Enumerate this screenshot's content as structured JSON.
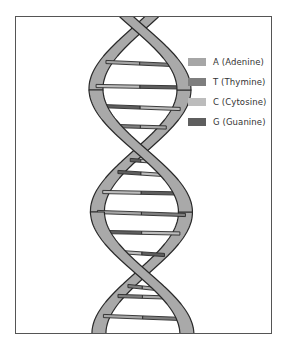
{
  "diagram": {
    "strand_color": "#a9a9a9",
    "outline_color": "#2a2a2a",
    "frame_color": "#555555"
  },
  "legend": {
    "items": [
      {
        "base": "A",
        "name": "Adenine",
        "label": "A  (Adenine)",
        "color": "#a6a6a6"
      },
      {
        "base": "T",
        "name": "Thymine",
        "label": "T  (Thymine)",
        "color": "#7e7e7e"
      },
      {
        "base": "C",
        "name": "Cytosine",
        "label": "C  (Cytosine)",
        "color": "#bcbcbc"
      },
      {
        "base": "G",
        "name": "Guanine",
        "label": "G  (Guanine)",
        "color": "#5e5e5e"
      }
    ]
  },
  "base_pairs": [
    {
      "left": "A",
      "right": "T"
    },
    {
      "left": "C",
      "right": "G"
    },
    {
      "left": "G",
      "right": "C"
    },
    {
      "left": "T",
      "right": "A"
    },
    {
      "left": "G",
      "right": "C"
    },
    {
      "left": "C",
      "right": "G"
    },
    {
      "left": "A",
      "right": "T"
    },
    {
      "left": "G",
      "right": "C"
    },
    {
      "left": "C",
      "right": "G"
    },
    {
      "left": "T",
      "right": "A"
    },
    {
      "left": "A",
      "right": "T"
    },
    {
      "left": "G",
      "right": "C"
    },
    {
      "left": "T",
      "right": "A"
    }
  ]
}
